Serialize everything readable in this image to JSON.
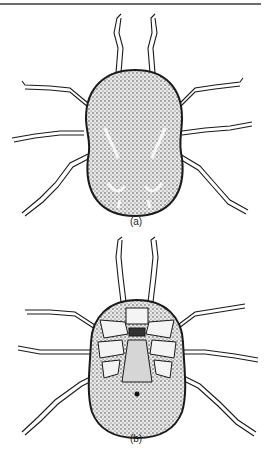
{
  "figure": {
    "panels": [
      {
        "label": "(a)",
        "view": "dorsal view"
      },
      {
        "label": "(b)",
        "view": "ventral view"
      }
    ]
  },
  "colors": {
    "ink": "#1a1a1a",
    "paper": "#ffffff",
    "rule": "#6a6a6a"
  }
}
